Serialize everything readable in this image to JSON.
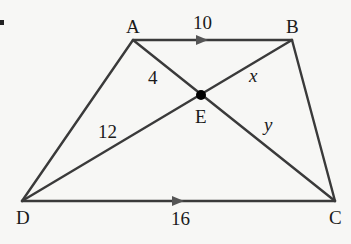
{
  "diagram": {
    "type": "trapezoid-with-diagonals",
    "points": {
      "A": "A",
      "B": "B",
      "C": "C",
      "D": "D",
      "E": "E"
    },
    "segment_labels": {
      "AB": "10",
      "DC": "16",
      "AE": "4",
      "DE": "12",
      "BE": "x",
      "CE": "y"
    },
    "parallel_sides": [
      "AB",
      "DC"
    ],
    "line_color": "#3a3a3a",
    "point_color": "#000000",
    "background": "#f7f7f5"
  }
}
